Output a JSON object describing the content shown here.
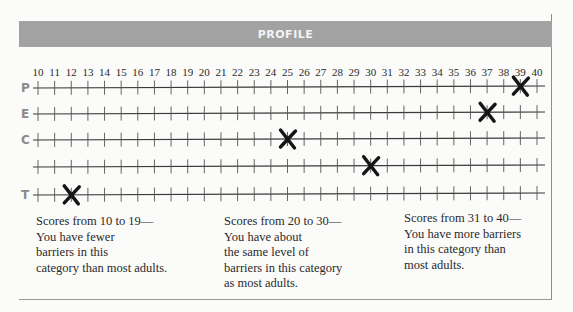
{
  "header": {
    "title": "PROFILE"
  },
  "chart_data": {
    "type": "scatter",
    "title": "PROFILE",
    "xlabel": "",
    "ylabel": "",
    "x_ticks": [
      10,
      11,
      12,
      13,
      14,
      15,
      16,
      17,
      18,
      19,
      20,
      21,
      22,
      23,
      24,
      25,
      26,
      27,
      28,
      29,
      30,
      31,
      32,
      33,
      34,
      35,
      36,
      37,
      38,
      39,
      40
    ],
    "xlim": [
      10,
      40
    ],
    "grid": false,
    "marker": "X",
    "rows": [
      {
        "label": "P",
        "score": 39
      },
      {
        "label": "E",
        "score": 37
      },
      {
        "label": "C",
        "score": 25
      },
      {
        "label": "",
        "score": 30
      },
      {
        "label": "T",
        "score": 12
      }
    ]
  },
  "notes": [
    {
      "lines": [
        "Scores from 10 to 19—",
        "You have fewer",
        "barriers in this",
        "category than most adults."
      ]
    },
    {
      "lines": [
        "Scores from 20 to 30—",
        "You have about",
        "the same level of",
        "barriers in this category",
        "as most adults."
      ]
    },
    {
      "lines": [
        "Scores from 31 to 40—",
        "You have more barriers",
        "in this category than",
        "most adults."
      ]
    }
  ]
}
